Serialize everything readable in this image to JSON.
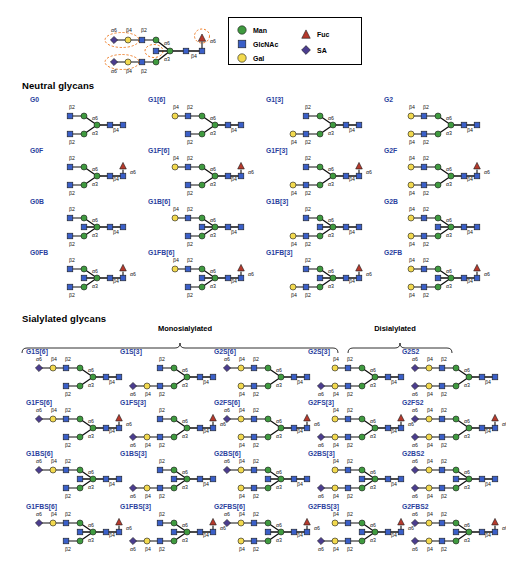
{
  "figure": {
    "sections": [
      {
        "id": "neutral",
        "title": "Neutral glycans"
      },
      {
        "id": "sialylated",
        "title": "Sialylated glycans"
      }
    ],
    "groups": [
      {
        "id": "mono",
        "title": "Monosialylated"
      },
      {
        "id": "di",
        "title": "Disialylated"
      }
    ]
  },
  "legend": {
    "items": [
      {
        "label": "Man",
        "shape": "circle",
        "color": "#3f9a3f",
        "icon": "man-circle-icon"
      },
      {
        "label": "GlcNAc",
        "shape": "square",
        "color": "#3a5fc8",
        "icon": "glcnac-square-icon"
      },
      {
        "label": "Gal",
        "shape": "circle",
        "color": "#f2d94e",
        "icon": "gal-circle-icon"
      },
      {
        "label": "Fuc",
        "shape": "triangle",
        "color": "#b5392c",
        "icon": "fuc-triangle-icon"
      },
      {
        "label": "SA",
        "shape": "diamond",
        "color": "#4b3d8f",
        "icon": "sa-diamond-icon"
      }
    ]
  },
  "reference": {
    "labels": {
      "upper_arm": [
        "α6",
        "β4",
        "β2"
      ],
      "lower_arm": [
        "α6",
        "β4",
        "β2"
      ],
      "man_a6": "α6",
      "man_a3": "α3",
      "core_b4": "β4",
      "fuc_a6": "α6"
    },
    "highlight_color": "#ef7f2a"
  },
  "link_labels": {
    "a6": "α6",
    "a3": "α3",
    "b4": "β4",
    "b2": "β2"
  },
  "neutral_rows": [
    [
      {
        "name": "G0",
        "gal6": false,
        "gal3": false,
        "sa6": false,
        "sa3": false,
        "fuc": false,
        "bisect": false
      },
      {
        "name": "G1[6]",
        "gal6": true,
        "gal3": false,
        "sa6": false,
        "sa3": false,
        "fuc": false,
        "bisect": false
      },
      {
        "name": "G1[3]",
        "gal6": false,
        "gal3": true,
        "sa6": false,
        "sa3": false,
        "fuc": false,
        "bisect": false
      },
      {
        "name": "G2",
        "gal6": true,
        "gal3": true,
        "sa6": false,
        "sa3": false,
        "fuc": false,
        "bisect": false
      }
    ],
    [
      {
        "name": "G0F",
        "gal6": false,
        "gal3": false,
        "sa6": false,
        "sa3": false,
        "fuc": true,
        "bisect": false
      },
      {
        "name": "G1F[6]",
        "gal6": true,
        "gal3": false,
        "sa6": false,
        "sa3": false,
        "fuc": true,
        "bisect": false
      },
      {
        "name": "G1F[3]",
        "gal6": false,
        "gal3": true,
        "sa6": false,
        "sa3": false,
        "fuc": true,
        "bisect": false
      },
      {
        "name": "G2F",
        "gal6": true,
        "gal3": true,
        "sa6": false,
        "sa3": false,
        "fuc": true,
        "bisect": false
      }
    ],
    [
      {
        "name": "G0B",
        "gal6": false,
        "gal3": false,
        "sa6": false,
        "sa3": false,
        "fuc": false,
        "bisect": true
      },
      {
        "name": "G1B[6]",
        "gal6": true,
        "gal3": false,
        "sa6": false,
        "sa3": false,
        "fuc": false,
        "bisect": true
      },
      {
        "name": "G1B[3]",
        "gal6": false,
        "gal3": true,
        "sa6": false,
        "sa3": false,
        "fuc": false,
        "bisect": true
      },
      {
        "name": "G2B",
        "gal6": true,
        "gal3": true,
        "sa6": false,
        "sa3": false,
        "fuc": false,
        "bisect": true
      }
    ],
    [
      {
        "name": "G0FB",
        "gal6": false,
        "gal3": false,
        "sa6": false,
        "sa3": false,
        "fuc": true,
        "bisect": true
      },
      {
        "name": "G1FB[6]",
        "gal6": true,
        "gal3": false,
        "sa6": false,
        "sa3": false,
        "fuc": true,
        "bisect": true
      },
      {
        "name": "G1FB[3]",
        "gal6": false,
        "gal3": true,
        "sa6": false,
        "sa3": false,
        "fuc": true,
        "bisect": true
      },
      {
        "name": "G2FB",
        "gal6": true,
        "gal3": true,
        "sa6": false,
        "sa3": false,
        "fuc": true,
        "bisect": true
      }
    ]
  ],
  "sialylated_rows": [
    [
      {
        "name": "G1S[6]",
        "gal6": true,
        "gal3": false,
        "sa6": true,
        "sa3": false,
        "fuc": false,
        "bisect": false
      },
      {
        "name": "G1S[3]",
        "gal6": false,
        "gal3": true,
        "sa6": false,
        "sa3": true,
        "fuc": false,
        "bisect": false
      },
      {
        "name": "G2S[6]",
        "gal6": true,
        "gal3": true,
        "sa6": true,
        "sa3": false,
        "fuc": false,
        "bisect": false
      },
      {
        "name": "G2S[3]",
        "gal6": true,
        "gal3": true,
        "sa6": false,
        "sa3": true,
        "fuc": false,
        "bisect": false
      },
      {
        "name": "G2S2",
        "gal6": true,
        "gal3": true,
        "sa6": true,
        "sa3": true,
        "fuc": false,
        "bisect": false
      }
    ],
    [
      {
        "name": "G1FS[6]",
        "gal6": true,
        "gal3": false,
        "sa6": true,
        "sa3": false,
        "fuc": true,
        "bisect": false
      },
      {
        "name": "G1FS[3]",
        "gal6": false,
        "gal3": true,
        "sa6": false,
        "sa3": true,
        "fuc": true,
        "bisect": false
      },
      {
        "name": "G2FS[6]",
        "gal6": true,
        "gal3": true,
        "sa6": true,
        "sa3": false,
        "fuc": true,
        "bisect": false
      },
      {
        "name": "G2FS[3]",
        "gal6": true,
        "gal3": true,
        "sa6": false,
        "sa3": true,
        "fuc": true,
        "bisect": false
      },
      {
        "name": "G2FS2",
        "gal6": true,
        "gal3": true,
        "sa6": true,
        "sa3": true,
        "fuc": true,
        "bisect": false
      }
    ],
    [
      {
        "name": "G1BS[6]",
        "gal6": true,
        "gal3": false,
        "sa6": true,
        "sa3": false,
        "fuc": false,
        "bisect": true
      },
      {
        "name": "G1BS[3]",
        "gal6": false,
        "gal3": true,
        "sa6": false,
        "sa3": true,
        "fuc": false,
        "bisect": true
      },
      {
        "name": "G2BS[6]",
        "gal6": true,
        "gal3": true,
        "sa6": true,
        "sa3": false,
        "fuc": false,
        "bisect": true
      },
      {
        "name": "G2BS[3]",
        "gal6": true,
        "gal3": true,
        "sa6": false,
        "sa3": true,
        "fuc": false,
        "bisect": true
      },
      {
        "name": "G2BS2",
        "gal6": true,
        "gal3": true,
        "sa6": true,
        "sa3": true,
        "fuc": false,
        "bisect": true
      }
    ],
    [
      {
        "name": "G1FBS[6]",
        "gal6": true,
        "gal3": false,
        "sa6": true,
        "sa3": false,
        "fuc": true,
        "bisect": true
      },
      {
        "name": "G1FBS[3]",
        "gal6": false,
        "gal3": true,
        "sa6": false,
        "sa3": true,
        "fuc": true,
        "bisect": true
      },
      {
        "name": "G2FBS[6]",
        "gal6": true,
        "gal3": true,
        "sa6": true,
        "sa3": false,
        "fuc": true,
        "bisect": true
      },
      {
        "name": "G2FBS[3]",
        "gal6": true,
        "gal3": true,
        "sa6": false,
        "sa3": true,
        "fuc": true,
        "bisect": true
      },
      {
        "name": "G2FBS2",
        "gal6": true,
        "gal3": true,
        "sa6": true,
        "sa3": true,
        "fuc": true,
        "bisect": true
      }
    ]
  ],
  "colors": {
    "man": "#3f9a3f",
    "glcnac": "#3a5fc8",
    "gal": "#f2d94e",
    "fuc": "#b5392c",
    "sa": "#4b3d8f",
    "name": "#2b3f9e",
    "bond": "#111111",
    "highlight": "#ef7f2a"
  }
}
